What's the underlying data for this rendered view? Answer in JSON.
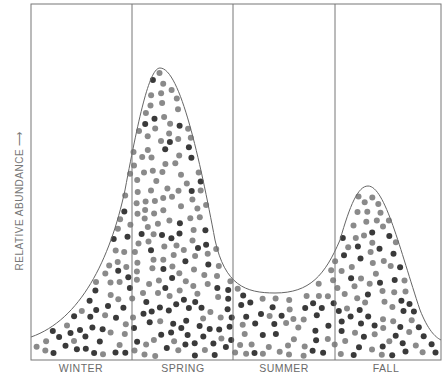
{
  "chart_data": {
    "type": "area",
    "title": "",
    "xlabel": "",
    "ylabel": "RELATIVE ABUNDANCE",
    "ylabel_arrow": "→",
    "categories": [
      "WINTER",
      "SPRING",
      "SUMMER",
      "FALL"
    ],
    "grid": false,
    "legend": null,
    "curve_points": [
      {
        "x": 0.0,
        "y": 0.07
      },
      {
        "x": 0.1,
        "y": 0.16
      },
      {
        "x": 0.2,
        "y": 0.45
      },
      {
        "x": 0.25,
        "y": 0.78
      },
      {
        "x": 0.32,
        "y": 0.82
      },
      {
        "x": 0.4,
        "y": 0.55
      },
      {
        "x": 0.5,
        "y": 0.22
      },
      {
        "x": 0.6,
        "y": 0.19
      },
      {
        "x": 0.76,
        "y": 0.35
      },
      {
        "x": 0.82,
        "y": 0.5
      },
      {
        "x": 0.9,
        "y": 0.4
      },
      {
        "x": 1.0,
        "y": 0.05
      }
    ],
    "relative_abundance_by_season": [
      {
        "season": "WINTER",
        "value": 0.25
      },
      {
        "season": "SPRING",
        "value": 0.82
      },
      {
        "season": "SUMMER",
        "value": 0.19
      },
      {
        "season": "FALL",
        "value": 0.5
      }
    ],
    "ylim": [
      0,
      1
    ],
    "dot_colors": {
      "light": "#8a8a8a",
      "dark": "#3a3a3a"
    }
  },
  "labels": {
    "winter": "WINTER",
    "spring": "SPRING",
    "summer": "SUMMER",
    "fall": "FALL",
    "ylabel": "RELATIVE ABUNDANCE ⟶"
  }
}
